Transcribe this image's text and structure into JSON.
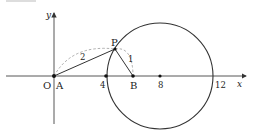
{
  "diagram": {
    "axes": {
      "x_label": "x",
      "y_label": "y"
    },
    "origin_label": "O",
    "points": {
      "A": {
        "label": "A",
        "coord": [
          0,
          0
        ]
      },
      "B": {
        "label": "B",
        "coord": [
          6,
          0
        ]
      },
      "P": {
        "label": "P"
      },
      "center": {
        "coord": [
          8,
          0
        ]
      }
    },
    "tick_labels": [
      "4",
      "8",
      "12"
    ],
    "segment_labels": {
      "AP": "2",
      "PB": "1"
    },
    "circle": {
      "center": [
        8,
        0
      ],
      "radius": 4
    },
    "colors": {
      "stroke": "#333333",
      "dashed": "#999999"
    }
  }
}
